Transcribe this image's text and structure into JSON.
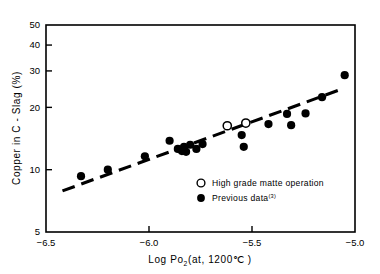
{
  "chart_data": {
    "type": "scatter",
    "title": "",
    "xlabel": "Log Po2 (at, 1200℃ )",
    "xlabel_parts": {
      "main": "Log Po",
      "subscript": "2",
      "tail": "(at, 1200℃ )"
    },
    "ylabel": "Copper in C - Slag (%)",
    "xlim": [
      -6.5,
      -5.0
    ],
    "ylim": [
      5,
      50
    ],
    "yscale": "log",
    "xscale": "linear",
    "xticks": [
      -6.5,
      -6.0,
      -5.5,
      -5.0
    ],
    "xticklabels": [
      "−6.5",
      "−6.0",
      "−5.5",
      "−5.0"
    ],
    "yticks": [
      5,
      10,
      20,
      30,
      40,
      50
    ],
    "yticklabels": [
      "5",
      "10",
      "20",
      "30",
      "40",
      "50"
    ],
    "grid": false,
    "legend_position": "lower right",
    "series": [
      {
        "name": "High grade matte operation",
        "marker": "open-circle",
        "color": "#000000",
        "points": [
          {
            "x": -5.62,
            "y": 16.3
          },
          {
            "x": -5.53,
            "y": 16.8
          }
        ]
      },
      {
        "name": "Previous data",
        "marker": "filled-circle",
        "color": "#000000",
        "reference": "(3)",
        "points": [
          {
            "x": -6.33,
            "y": 9.3
          },
          {
            "x": -6.2,
            "y": 10.0
          },
          {
            "x": -6.02,
            "y": 11.6
          },
          {
            "x": -5.9,
            "y": 13.8
          },
          {
            "x": -5.86,
            "y": 12.6
          },
          {
            "x": -5.84,
            "y": 12.3
          },
          {
            "x": -5.83,
            "y": 12.9
          },
          {
            "x": -5.82,
            "y": 12.2
          },
          {
            "x": -5.8,
            "y": 13.2
          },
          {
            "x": -5.77,
            "y": 12.6
          },
          {
            "x": -5.74,
            "y": 13.3
          },
          {
            "x": -5.55,
            "y": 14.7
          },
          {
            "x": -5.54,
            "y": 12.9
          },
          {
            "x": -5.42,
            "y": 16.6
          },
          {
            "x": -5.33,
            "y": 18.6
          },
          {
            "x": -5.31,
            "y": 16.4
          },
          {
            "x": -5.24,
            "y": 18.7
          },
          {
            "x": -5.16,
            "y": 22.4
          },
          {
            "x": -5.05,
            "y": 28.6
          }
        ]
      }
    ],
    "trendline": {
      "style": "dashed",
      "start": {
        "x": -6.42,
        "y": 7.9
      },
      "end": {
        "x": -5.06,
        "y": 24.6
      }
    },
    "annotations": []
  },
  "legend": {
    "items": [
      {
        "marker": "open-circle",
        "label": "High grade matte operation",
        "sup": ""
      },
      {
        "marker": "filled-circle",
        "label": "Previous data",
        "sup": "(3)"
      }
    ]
  },
  "axis": {
    "y_title": "Copper in C - Slag (%)",
    "x_title_main": "Log Po",
    "x_title_sub": "2",
    "x_title_tail": "(at, 1200℃ )"
  },
  "colors": {
    "ink": "#000000",
    "background": "#ffffff"
  }
}
